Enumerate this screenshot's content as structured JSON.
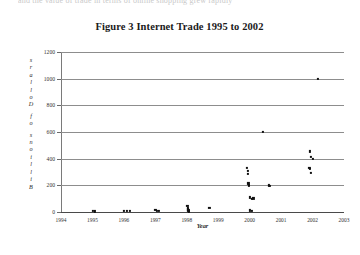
{
  "page": {
    "top_cut_text": "and the value of trade in terms of online shopping grew rapidly"
  },
  "figure": {
    "title": "Figure 3 Internet Trade 1995 to 2002"
  },
  "chart_data": {
    "type": "scatter",
    "title": "Figure 3 Internet Trade 1995 to 2002",
    "xlabel": "Year",
    "ylabel": "Billions of Dollars",
    "xlim": [
      1994,
      2003
    ],
    "ylim": [
      0,
      1200
    ],
    "grid": true,
    "legend": "none",
    "xticks": [
      1994,
      1995,
      1996,
      1997,
      1998,
      1999,
      2000,
      2001,
      2002,
      2003
    ],
    "yticks": [
      0,
      200,
      400,
      600,
      800,
      1000,
      1200
    ],
    "ylabel_chars": [
      "B",
      "i",
      "l",
      "l",
      "i",
      "o",
      "n",
      "s",
      "o",
      "f",
      "D",
      "o",
      "l",
      "l",
      "a",
      "r",
      "s"
    ],
    "points": [
      {
        "x": 1995.02,
        "y": 6
      },
      {
        "x": 1995.08,
        "y": 4
      },
      {
        "x": 1996.0,
        "y": 10
      },
      {
        "x": 1996.1,
        "y": 8
      },
      {
        "x": 1996.18,
        "y": 6
      },
      {
        "x": 1997.0,
        "y": 14
      },
      {
        "x": 1997.05,
        "y": 10
      },
      {
        "x": 1997.12,
        "y": 7
      },
      {
        "x": 1998.02,
        "y": 44
      },
      {
        "x": 1998.03,
        "y": 30
      },
      {
        "x": 1998.04,
        "y": 20
      },
      {
        "x": 1998.05,
        "y": 12
      },
      {
        "x": 1998.06,
        "y": 5
      },
      {
        "x": 1998.72,
        "y": 28
      },
      {
        "x": 1999.92,
        "y": 330
      },
      {
        "x": 1999.94,
        "y": 310
      },
      {
        "x": 1999.95,
        "y": 285
      },
      {
        "x": 1999.96,
        "y": 215
      },
      {
        "x": 1999.97,
        "y": 205
      },
      {
        "x": 1999.98,
        "y": 195
      },
      {
        "x": 2000.0,
        "y": 110
      },
      {
        "x": 2000.06,
        "y": 100
      },
      {
        "x": 2000.12,
        "y": 102
      },
      {
        "x": 2000.02,
        "y": 12
      },
      {
        "x": 2000.08,
        "y": 8
      },
      {
        "x": 2000.42,
        "y": 600
      },
      {
        "x": 2000.62,
        "y": 200
      },
      {
        "x": 2000.64,
        "y": 196
      },
      {
        "x": 2001.92,
        "y": 455
      },
      {
        "x": 2001.94,
        "y": 415
      },
      {
        "x": 2002.0,
        "y": 400
      },
      {
        "x": 2001.9,
        "y": 330
      },
      {
        "x": 2001.92,
        "y": 322
      },
      {
        "x": 2001.95,
        "y": 295
      },
      {
        "x": 2002.18,
        "y": 1000
      }
    ]
  }
}
